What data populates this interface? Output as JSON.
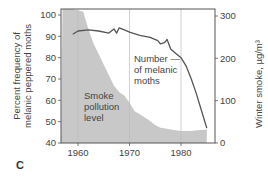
{
  "chart_data": {
    "type": "line+area",
    "title": "",
    "panel_label": "C",
    "xlabel": "",
    "x_ticks": [
      1960,
      1970,
      1980
    ],
    "xlim": [
      1957,
      1987
    ],
    "ylabel_left": "Percent frequency of melanic peppered moths",
    "ylabel_left_lines": [
      "Percent frequency of",
      "melanic peppered moths"
    ],
    "ylim_left": [
      40,
      100
    ],
    "y_ticks_left": [
      40,
      50,
      60,
      70,
      80,
      90,
      100
    ],
    "ylabel_right": "Winter smoke, µg/m³",
    "ylim_right": [
      0,
      300
    ],
    "y_ticks_right": [
      0,
      100,
      200,
      300
    ],
    "grid": "vertical lines at 1960, 1970, 1980",
    "series": [
      {
        "name": "Number of melanic moths",
        "type": "line",
        "axis": "left",
        "color": "#555555",
        "x": [
          1959,
          1960,
          1962,
          1964,
          1966,
          1967,
          1967.5,
          1968,
          1969,
          1970,
          1972,
          1974,
          1975.5,
          1976,
          1976.8,
          1977.3,
          1978,
          1979,
          1980,
          1981,
          1982,
          1983,
          1984,
          1985
        ],
        "values": [
          91,
          92.5,
          93,
          92.5,
          91.5,
          93.5,
          91.5,
          94,
          93,
          92,
          90.5,
          89.5,
          88,
          86.5,
          87,
          88.5,
          84,
          82,
          80,
          76,
          70,
          63,
          55,
          47
        ]
      },
      {
        "name": "Smoke pollution level",
        "type": "area",
        "axis": "right",
        "color": "#c8c8c8",
        "x": [
          1957,
          1959,
          1961,
          1962,
          1963,
          1964,
          1965,
          1966,
          1967,
          1968,
          1969,
          1970,
          1971,
          1972,
          1973,
          1974,
          1975,
          1976,
          1977,
          1978,
          1979,
          1980,
          1981,
          1982,
          1983,
          1984,
          1985
        ],
        "values": [
          320,
          320,
          310,
          270,
          235,
          210,
          185,
          160,
          135,
          120,
          112,
          95,
          75,
          68,
          60,
          52,
          42,
          36,
          34,
          32,
          30,
          28,
          28,
          28,
          30,
          31,
          32
        ]
      }
    ],
    "annotations": [
      {
        "text_lines": [
          "Number —",
          "of melanic",
          "moths"
        ],
        "target": "melanic moth line"
      },
      {
        "text_lines": [
          "Smoke",
          "pollution",
          "level"
        ],
        "target": "smoke area"
      }
    ]
  }
}
